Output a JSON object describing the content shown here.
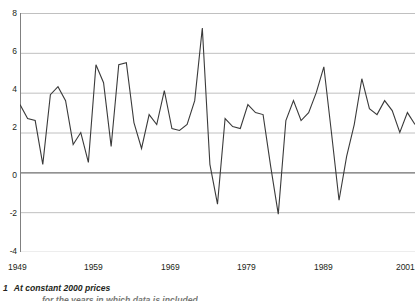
{
  "footnote": {
    "marker": "1",
    "text": "At constant 2000 prices",
    "clipped_line": "for the years in which data is included"
  },
  "axis": {
    "y_ticks": [
      "8",
      "6",
      "4",
      "2",
      "0",
      "-2",
      "-4"
    ],
    "x_ticks": [
      "1949",
      "1959",
      "1969",
      "1979",
      "1989",
      "2001"
    ]
  },
  "style": {
    "line_color": "#3a3a3a",
    "grid_color": "#b9b9b9",
    "zero_line_color": "#6e6e6e",
    "axis_color": "#808080",
    "text_color": "#231f20",
    "background": "#ffffff"
  },
  "chart_data": {
    "type": "line",
    "title": "",
    "subtitle": "",
    "xlabel": "",
    "ylabel": "",
    "xlim": [
      1949,
      2001
    ],
    "ylim": [
      -4,
      8
    ],
    "grid": true,
    "legend": "none",
    "y_tick_values": [
      8,
      6,
      4,
      2,
      0,
      -2,
      -4
    ],
    "x_tick_values": [
      1949,
      1959,
      1969,
      1979,
      1989,
      2001
    ],
    "annotations": [
      "1 At constant 2000 prices"
    ],
    "series": [
      {
        "name": "Annual growth rate",
        "x": [
          1949,
          1950,
          1951,
          1952,
          1953,
          1954,
          1955,
          1956,
          1957,
          1958,
          1959,
          1960,
          1961,
          1962,
          1963,
          1964,
          1965,
          1966,
          1967,
          1968,
          1969,
          1970,
          1971,
          1972,
          1973,
          1974,
          1975,
          1976,
          1977,
          1978,
          1979,
          1980,
          1981,
          1982,
          1983,
          1984,
          1985,
          1986,
          1987,
          1988,
          1989,
          1990,
          1991,
          1992,
          1993,
          1994,
          1995,
          1996,
          1997,
          1998,
          1999,
          2000,
          2001
        ],
        "values": [
          3.4,
          2.7,
          2.6,
          0.4,
          3.9,
          4.3,
          3.6,
          1.4,
          2.0,
          0.5,
          5.4,
          4.5,
          1.3,
          5.4,
          5.5,
          2.5,
          1.2,
          2.9,
          2.4,
          4.1,
          2.2,
          2.1,
          2.4,
          3.6,
          7.25,
          0.4,
          -1.6,
          2.7,
          2.3,
          2.2,
          3.4,
          3.0,
          2.9,
          0.3,
          -2.1,
          2.6,
          3.6,
          2.6,
          3.0,
          4.0,
          5.3,
          2.0,
          -1.4,
          0.8,
          2.4,
          4.7,
          3.2,
          2.9,
          3.6,
          3.1,
          2.0,
          3.0,
          2.4
        ]
      }
    ]
  }
}
